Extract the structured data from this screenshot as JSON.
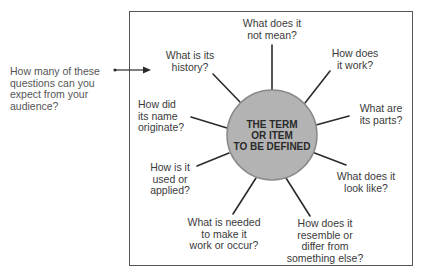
{
  "prompt": {
    "lines": [
      "How many of these",
      "questions can you",
      "expect from your",
      "audience?"
    ]
  },
  "center": {
    "lines": [
      "THE TERM",
      "OR ITEM",
      "TO BE DEFINED"
    ],
    "fill": "#b3b3b3",
    "stroke": "#888888"
  },
  "questions": [
    {
      "id": "not-mean",
      "lines": [
        "What does it",
        "not mean?"
      ]
    },
    {
      "id": "how-work",
      "lines": [
        "How does",
        "it work?"
      ]
    },
    {
      "id": "parts",
      "lines": [
        "What are",
        "its parts?"
      ]
    },
    {
      "id": "look-like",
      "lines": [
        "What does it",
        "look like?"
      ]
    },
    {
      "id": "resemble",
      "lines": [
        "How does it",
        "resemble or",
        "differ from",
        "something else?"
      ]
    },
    {
      "id": "needed",
      "lines": [
        "What is needed",
        "to make it",
        "work or occur?"
      ]
    },
    {
      "id": "used",
      "lines": [
        "How is it",
        "used or",
        "applied?"
      ]
    },
    {
      "id": "originate",
      "lines": [
        "How did",
        "its name",
        "originate?"
      ]
    },
    {
      "id": "history",
      "lines": [
        "What is its",
        "history?"
      ]
    }
  ],
  "colors": {
    "line": "#2b2b2b",
    "frame": "#555555",
    "text": "#3a3a3a"
  }
}
